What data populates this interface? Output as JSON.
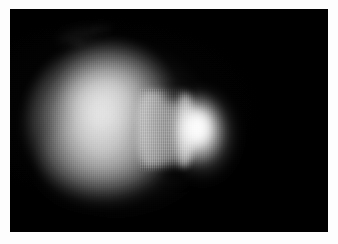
{
  "figure": {
    "kind": "grayscale-astronomical-image",
    "caption": "",
    "width_px": 338,
    "height_px": 244,
    "border": {
      "color": "#fdfdfd",
      "left_px": 10,
      "top_px": 9,
      "right_px": 10,
      "bottom_px": 12
    },
    "plate": {
      "background_color": "#000000",
      "width_px": 318,
      "height_px": 223,
      "colormap": "grayscale"
    }
  },
  "features": [
    {
      "id": "halo-outer",
      "label": "outer diffuse halo",
      "shape": "ellipse",
      "center_px": [
        110,
        115
      ],
      "peak_gray": 80
    },
    {
      "id": "lobe-main",
      "label": "large diffuse left lobe",
      "shape": "rounded-bulb",
      "center_px": [
        100,
        115
      ],
      "peak_gray": 165
    },
    {
      "id": "lobe-shoulder",
      "label": "upper shoulder extension",
      "shape": "rounded",
      "center_px": [
        111,
        72
      ],
      "peak_gray": 130
    },
    {
      "id": "lobe-lower",
      "label": "lower bulge",
      "shape": "rounded",
      "center_px": [
        100,
        155
      ],
      "peak_gray": 125
    },
    {
      "id": "core-left",
      "label": "bright inner core of left lobe",
      "shape": "ellipse",
      "center_px": [
        92,
        110
      ],
      "peak_gray": 160
    },
    {
      "id": "neck",
      "label": "narrow textured neck",
      "shape": "band",
      "center_px": [
        157,
        120
      ],
      "peak_gray": 150
    },
    {
      "id": "notch-top",
      "label": "dark notch above neck",
      "shape": "ellipse",
      "center_px": [
        165,
        85
      ],
      "peak_gray": 20
    },
    {
      "id": "notch-bottom",
      "label": "dark notch below neck",
      "shape": "ellipse",
      "center_px": [
        168,
        163
      ],
      "peak_gray": 18
    },
    {
      "id": "lobe-right",
      "label": "bright compact right lobe",
      "shape": "rounded",
      "center_px": [
        193,
        122
      ],
      "peak_gray": 245
    },
    {
      "id": "core-right",
      "label": "brightest core of right lobe",
      "shape": "ellipse",
      "center_px": [
        189,
        119
      ],
      "peak_gray": 252
    },
    {
      "id": "rim-right",
      "label": "bright leading rim crescent",
      "shape": "arc",
      "center_px": [
        174,
        122
      ],
      "peak_gray": 210
    },
    {
      "id": "wisp-a",
      "label": "faint wisp artifact upper-left",
      "shape": "streak",
      "center_px": [
        68,
        27
      ],
      "peak_gray": 28
    },
    {
      "id": "wisp-b",
      "label": "faint wisp artifact upper-center",
      "shape": "streak",
      "center_px": [
        91,
        20
      ],
      "peak_gray": 24
    },
    {
      "id": "wisp-c",
      "label": "faint wisp artifact",
      "shape": "streak",
      "center_px": [
        67,
        33
      ],
      "peak_gray": 22
    }
  ],
  "overlays": {
    "scanlines": "vertical column noise",
    "grain": "horizontal sensor grain",
    "vignette": "corner falloff"
  }
}
